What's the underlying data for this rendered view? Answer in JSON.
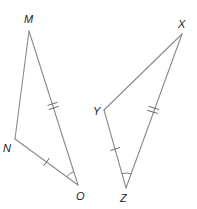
{
  "diagram": {
    "triangles": [
      {
        "name": "MNO",
        "vertices": {
          "M": {
            "label": "M",
            "x": 29,
            "y": 31,
            "lx": 24,
            "ly": 23
          },
          "N": {
            "label": "N",
            "x": 15,
            "y": 139,
            "lx": 3,
            "ly": 152
          },
          "O": {
            "label": "O",
            "x": 78,
            "y": 185,
            "lx": 76,
            "ly": 200
          }
        },
        "markings": {
          "MO": "double-tick",
          "NO": "single-tick",
          "angle_O": "single-arc"
        }
      },
      {
        "name": "XYZ",
        "vertices": {
          "X": {
            "label": "X",
            "x": 182,
            "y": 34,
            "lx": 178,
            "ly": 28
          },
          "Y": {
            "label": "Y",
            "x": 104,
            "y": 110,
            "lx": 93,
            "ly": 115
          },
          "Z": {
            "label": "Z",
            "x": 126,
            "y": 188,
            "lx": 120,
            "ly": 202
          }
        },
        "markings": {
          "XZ": "double-tick",
          "YZ": "single-tick",
          "angle_Z": "single-arc"
        }
      }
    ],
    "colors": {
      "line": "#8a8a8a",
      "label": "#222222",
      "background": "#ffffff"
    }
  }
}
